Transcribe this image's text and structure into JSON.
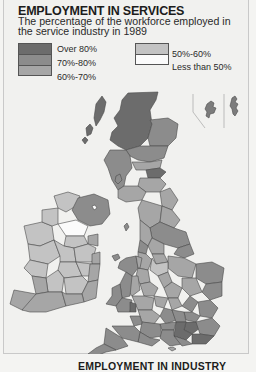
{
  "header": {
    "title": "EMPLOYMENT IN SERVICES",
    "subtitle": "The percentage of the workforce employed in the service industry in 1989"
  },
  "legend": {
    "items": [
      {
        "label": "Over 80%",
        "color": "#6c6c6c"
      },
      {
        "label": "70%-80%",
        "color": "#8c8c8c"
      },
      {
        "label": "60%-70%",
        "color": "#a6a6a6"
      },
      {
        "label": "50%-60%",
        "color": "#c3c3c3"
      },
      {
        "label": "Less than 50%",
        "color": "#fbfbfb"
      }
    ]
  },
  "map": {
    "region": "British Isles",
    "inset": "Orkney and Shetland",
    "background": "#f1f1ef",
    "border_color": "#4a4a4a"
  },
  "footer": {
    "next_caption": "EMPLOYMENT IN INDUSTRY"
  }
}
